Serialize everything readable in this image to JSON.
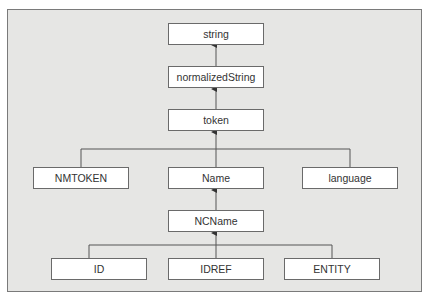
{
  "diagram": {
    "type": "type-hierarchy",
    "colors": {
      "frame_background": "#e6e6e4",
      "frame_border": "#7a7a7a",
      "node_background": "#ffffff",
      "node_border": "#6a6a6a",
      "line": "#555555",
      "text": "#333333"
    },
    "nodes": {
      "string": {
        "label": "string"
      },
      "normalizedString": {
        "label": "normalizedString"
      },
      "token": {
        "label": "token"
      },
      "NMTOKEN": {
        "label": "NMTOKEN"
      },
      "Name": {
        "label": "Name"
      },
      "language": {
        "label": "language"
      },
      "NCName": {
        "label": "NCName"
      },
      "ID": {
        "label": "ID"
      },
      "IDREF": {
        "label": "IDREF"
      },
      "ENTITY": {
        "label": "ENTITY"
      }
    },
    "edges": [
      {
        "from": "normalizedString",
        "to": "string"
      },
      {
        "from": "token",
        "to": "normalizedString"
      },
      {
        "from": "NMTOKEN",
        "to": "token"
      },
      {
        "from": "Name",
        "to": "token"
      },
      {
        "from": "language",
        "to": "token"
      },
      {
        "from": "NCName",
        "to": "Name"
      },
      {
        "from": "ID",
        "to": "NCName"
      },
      {
        "from": "IDREF",
        "to": "NCName"
      },
      {
        "from": "ENTITY",
        "to": "NCName"
      }
    ]
  }
}
